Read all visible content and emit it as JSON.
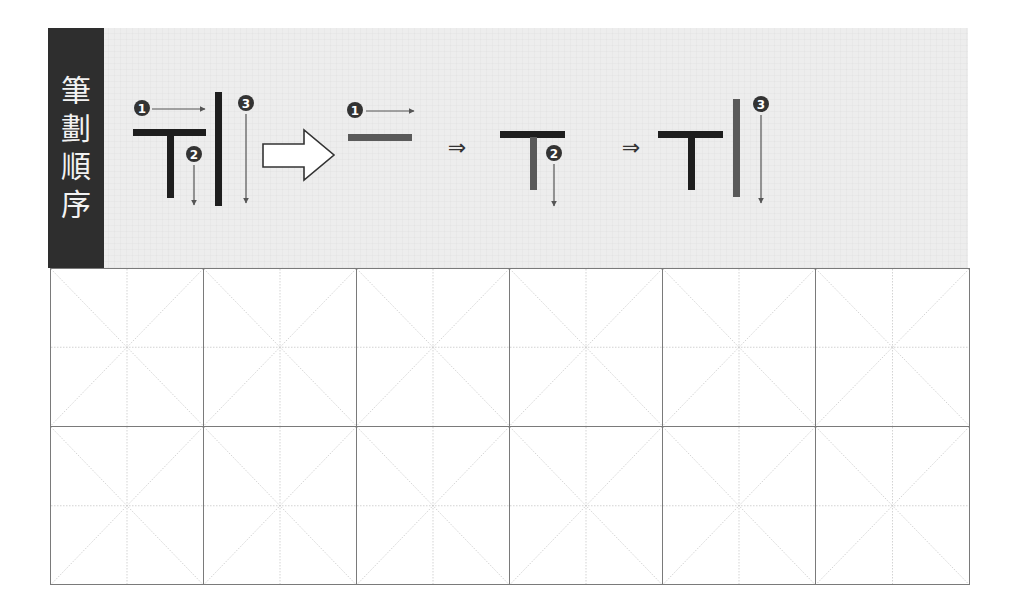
{
  "section_label": {
    "title": "筆劃順序",
    "chars": [
      "筆",
      "劃",
      "順",
      "序"
    ]
  },
  "character": {
    "name": "T-shaped character with vertical stroke",
    "stroke_count": 3
  },
  "stroke_order": {
    "overview": {
      "markers": [
        {
          "number": "1",
          "glyph": "❶",
          "direction": "right"
        },
        {
          "number": "2",
          "glyph": "❷",
          "direction": "down"
        },
        {
          "number": "3",
          "glyph": "❸",
          "direction": "down"
        }
      ]
    },
    "separator_big_arrow": "hollow-right-arrow",
    "steps": [
      {
        "step": 1,
        "marker": "❶",
        "direction": "right",
        "highlight_stroke": 1
      },
      {
        "step": 2,
        "marker": "❷",
        "direction": "down",
        "highlight_stroke": 2
      },
      {
        "step": 3,
        "marker": "❸",
        "direction": "down",
        "highlight_stroke": 3
      }
    ],
    "step_separator": "⇒"
  },
  "colors": {
    "label_bg": "#2e2e2e",
    "label_text": "#f2f2f2",
    "band_bg": "#ededed",
    "stroke_done": "#1e1e1e",
    "stroke_current": "#5a5a5a",
    "arrow": "#555555",
    "grid_border": "#7a7a7a",
    "guide_dash": "#c8c8c8"
  },
  "practice_grid": {
    "columns": 6,
    "rows": 2,
    "cell_style": "米字格 (diagonal + cross dashed guides)"
  }
}
